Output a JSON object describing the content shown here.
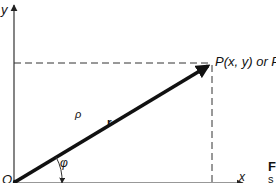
{
  "diagram": {
    "type": "polar-cartesian-coordinates",
    "axes": {
      "x_label": "x",
      "y_label": "y",
      "origin_label": "O"
    },
    "point": {
      "label": "P(x, y) or P(ρ, φ)"
    },
    "vector": {
      "name": "r",
      "magnitude_label": "ρ",
      "angle_label": "φ"
    },
    "caption_fragment": {
      "line1": "F",
      "line2": "s"
    },
    "colors": {
      "background": "#ffffff",
      "ink": "#111111",
      "axis": "#333333",
      "dashed": "#333333"
    }
  }
}
